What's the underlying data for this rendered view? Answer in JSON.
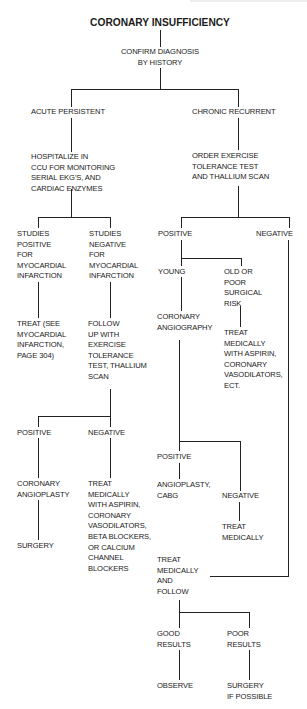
{
  "title": "CORONARY INSUFFICIENCY",
  "nodes": {
    "confirm": "CONFIRM DIAGNOSIS\nBY HISTORY",
    "acute": "ACUTE PERSISTENT",
    "chronic": "CHRONIC RECURRENT",
    "hospitalize": "HOSPITALIZE IN\nCCU FOR MONITORING\nSERIAL EKG'S, AND\nCARDIAC ENZYMES",
    "studies_pos": "STUDIES\nPOSITIVE\nFOR\nMYOCARDIAL\nINFARCTION",
    "studies_neg": "STUDIES\nNEGATIVE\nFOR\nMYOCARDIAL\nINFARCTION",
    "treat_mi": "TREAT (SEE\nMYOCARDIAL\nINFARCTION,\nPAGE 304)",
    "follow_up": "FOLLOW\nUP WITH\nEXERCISE\nTOLERANCE\nTEST, THALLIUM\nSCAN",
    "acute_positive": "POSITIVE",
    "acute_negative": "NEGATIVE",
    "coronary_angioplasty": "CORONARY\nANGIOPLASTY",
    "surgery": "SURGERY",
    "treat_medically_beta": "TREAT\nMEDICALLY\nWITH ASPIRIN,\nCORONARY\nVASODILATORS,\nBETA BLOCKERS,\nOR CALCIUM\nCHANNEL\nBLOCKERS",
    "order_exercise": "ORDER EXERCISE\nTOLERANCE TEST\nAND THALLIUM SCAN",
    "chronic_positive": "POSITIVE",
    "chronic_negative": "NEGATIVE",
    "young": "YOUNG",
    "old_poor": "OLD OR\nPOOR\nSURGICAL\nRISK",
    "coronary_angiography": "CORONARY\nANGIOGRAPHY",
    "treat_medically_ect": "TREAT\nMEDICALLY\nWITH ASPIRIN,\nCORONARY\nVASODILATORS,\nECT.",
    "angio_positive": "POSITIVE",
    "angioplasty_cabg": "ANGIOPLASTY,\nCABG",
    "angio_negative": "NEGATIVE",
    "treat_medically": "TREAT\nMEDICALLY",
    "treat_follow": "TREAT\nMEDICALLY\nAND\nFOLLOW",
    "good_results": "GOOD\nRESULTS",
    "poor_results": "POOR\nRESULTS",
    "observe": "OBSERVE",
    "surgery_if_possible": "SURGERY\nIF POSSIBLE"
  }
}
